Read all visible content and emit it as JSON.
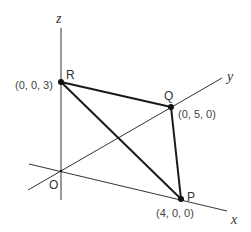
{
  "diagram": {
    "type": "3d-coordinate-triangle",
    "axes": {
      "x": {
        "label": "x"
      },
      "y": {
        "label": "y"
      },
      "z": {
        "label": "z"
      },
      "origin": {
        "label": "O"
      }
    },
    "points": [
      {
        "name": "P",
        "coords": "(4, 0, 0)"
      },
      {
        "name": "Q",
        "coords": "(0, 5, 0)"
      },
      {
        "name": "R",
        "coords": "(0, 0, 3)"
      }
    ],
    "edges": [
      [
        "P",
        "Q"
      ],
      [
        "Q",
        "R"
      ],
      [
        "R",
        "P"
      ]
    ]
  }
}
